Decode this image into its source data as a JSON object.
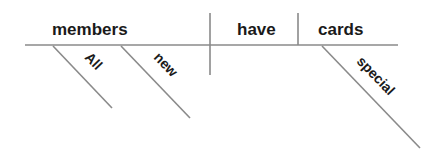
{
  "diagram": {
    "type": "sentence-diagram",
    "sentence": "All new members have special cards",
    "subject": "members",
    "verb": "have",
    "direct_object": "cards",
    "subject_modifiers": [
      "All",
      "new"
    ],
    "object_modifiers": [
      "special"
    ],
    "line_color": "#8a8a8a",
    "text_color": "#1a1a1a"
  }
}
